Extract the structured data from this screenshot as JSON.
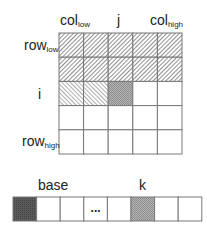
{
  "matrix": {
    "rows": 5,
    "cols": 5,
    "x": 59,
    "y": 33,
    "cell_w": 24.6,
    "cell_h": 24.2,
    "column_labels": [
      {
        "main": "col",
        "sub": "low",
        "x": 60,
        "y": 13
      },
      {
        "main": "j",
        "sub": "",
        "x": 117,
        "y": 13
      },
      {
        "main": "col",
        "sub": "high",
        "x": 150,
        "y": 13
      }
    ],
    "row_labels": [
      {
        "main": "row",
        "sub": "low",
        "x": 24,
        "y": 38
      },
      {
        "main": "i",
        "sub": "",
        "x": 38,
        "y": 87
      },
      {
        "main": "row",
        "sub": "high",
        "x": 22,
        "y": 134
      }
    ],
    "cell_states": [
      [
        "done",
        "done",
        "done",
        "done",
        "done"
      ],
      [
        "done",
        "done",
        "done",
        "done",
        "done"
      ],
      [
        "partial",
        "partial",
        "current",
        "empty",
        "empty"
      ],
      [
        "empty",
        "empty",
        "empty",
        "empty",
        "empty"
      ],
      [
        "empty",
        "empty",
        "empty",
        "empty",
        "empty"
      ]
    ]
  },
  "array": {
    "x": 13,
    "y": 197,
    "cell_w": 23.6,
    "cell_h": 24,
    "labels": [
      {
        "text": "base",
        "x": 38,
        "y": 178
      },
      {
        "text": "k",
        "x": 139,
        "y": 178
      }
    ],
    "cells": [
      "base",
      "empty",
      "empty",
      "ellipsis",
      "empty",
      "current",
      "empty",
      "empty"
    ],
    "ellipsis": "..."
  },
  "colors": {
    "line": "#777777",
    "hatch": "#6a6a6a",
    "current_fill": "#a8a8a8",
    "base_fill": "#555555"
  }
}
